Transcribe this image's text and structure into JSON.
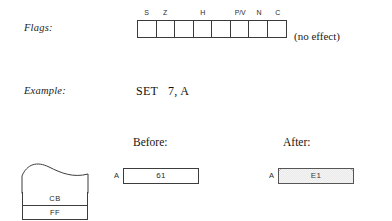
{
  "flags": {
    "label": "Flags:",
    "note": "(no effect)",
    "bit_names": [
      "S",
      "Z",
      "",
      "H",
      "",
      "P/V",
      "N",
      "C"
    ],
    "bit_values": [
      "",
      "",
      "",
      "",
      "",
      "",
      "",
      ""
    ]
  },
  "example": {
    "label": "Example:",
    "code": "SET   7, A"
  },
  "states": {
    "before_heading": "Before:",
    "after_heading": "After:",
    "before": {
      "register": "A",
      "value": "61"
    },
    "after": {
      "register": "A",
      "value": "E1"
    }
  },
  "memory": {
    "cells": [
      {
        "value": "CB"
      },
      {
        "value": "FF"
      }
    ]
  }
}
